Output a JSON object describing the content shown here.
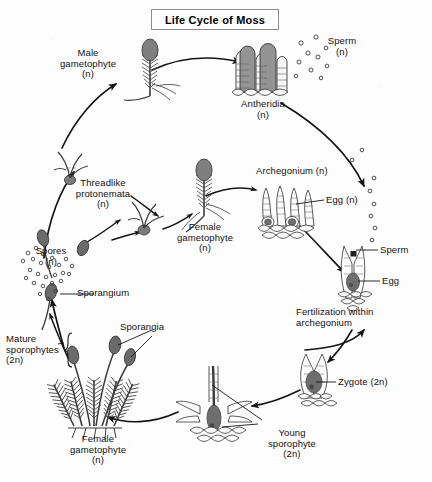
{
  "title": {
    "text": "Life Cycle of Moss"
  },
  "labels": {
    "male_gametophyte": "Male\ngametophyte\n(n)",
    "antheridia": "Antheridia\n(n)",
    "sperm_cloud": "Sperm\n(n)",
    "archegonium": "Archegonium (n)",
    "egg_n": "Egg (n)",
    "sperm": "Sperm",
    "egg": "Egg",
    "fertilization": "Fertilization within\narchegonium",
    "zygote": "Zygote (2n)",
    "young_sporophyte": "Young\nsporophyte\n(2n)",
    "female_gametophyte_bottom": "Female\ngametophyte\n(n)",
    "mature_sporophytes": "Mature\nsporophytes\n(2n)",
    "sporangia": "Sporangia",
    "sporangium": "Sporangium",
    "spores": "Spores\n(n)",
    "threadlike_protonemata": "Threadlike\nprotonemata\n(n)",
    "female_gametophyte_center": "Female\ngametophyte\n(n)"
  },
  "colors": {
    "ink": "#111111",
    "line": "#1a1a1a",
    "fill_gray": "#8d8d8d",
    "fill_light": "#d8d8d8",
    "background": "#fdfdfd",
    "title_border": "#8c8c8c"
  },
  "diagram": {
    "type": "life-cycle",
    "organism": "Moss",
    "stages": [
      "Spores (n)",
      "Threadlike protonemata (n)",
      "Male gametophyte (n)",
      "Female gametophyte (n)",
      "Antheridia (n)",
      "Archegonium (n)",
      "Sperm (n)",
      "Egg (n)",
      "Fertilization within archegonium",
      "Zygote (2n)",
      "Young sporophyte (2n)",
      "Mature sporophytes (2n)",
      "Sporangia"
    ]
  }
}
